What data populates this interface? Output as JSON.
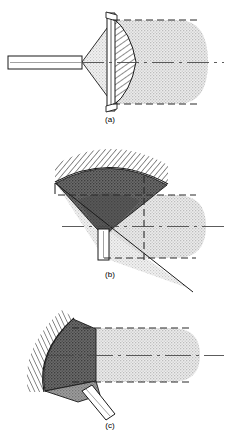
{
  "figure": {
    "name": "ultrasonic-transducer-beam-focusing-figure",
    "width": 226,
    "height": 442,
    "background": "#ffffff"
  },
  "colors": {
    "background": "#ffffff",
    "outline": "#1a1a1a",
    "beam_fill": "#e2e2e2",
    "beam_fill_light": "#eaeaea",
    "cone_dark": "#5a5a5a",
    "cone_mid": "#8c8c8c",
    "wedge_dark": "#6e6e6e",
    "wedge_mid": "#9a9a9a",
    "hatch_stroke": "#2a2a2a",
    "dashed_stroke": "#2a2a2a",
    "centerline": "#3a3a3a",
    "caption_text": "#4a4a4a",
    "lens_hatch": "#2e2e2e"
  },
  "panels": [
    {
      "id": "a",
      "caption": "(a)",
      "caption_x": 110,
      "caption_y": 122,
      "description": "flat transducer with plano-convex focusing lens on axial rod",
      "centerline_y": 62,
      "elements": {
        "rod": {
          "name": "transducer-rod",
          "x": 8,
          "y": 56,
          "width": 74,
          "height": 13
        },
        "lens": {
          "name": "focusing-lens",
          "face_x": 113,
          "top_y": 16,
          "bottom_y": 108
        },
        "plate": {
          "name": "transducer-plate",
          "x": 108,
          "top_y": 12,
          "bottom_y": 112
        },
        "beam": {
          "name": "beam-field",
          "left_x": 113,
          "right_x": 208,
          "top_y": 20,
          "bottom_y": 104
        },
        "cone": {
          "name": "convergence-cone",
          "apex_x": 82,
          "base_x": 113
        }
      }
    },
    {
      "id": "b",
      "caption": "(b)",
      "caption_x": 110,
      "caption_y": 277,
      "description": "concave curved reflector with conical beam and vertical stem",
      "centerline_y": 226,
      "elements": {
        "reflector_arc": {
          "name": "curved-reflector-surface",
          "hatched": true
        },
        "cone": {
          "name": "focusing-cone",
          "apex_x": 104,
          "apex_y": 228
        },
        "stem": {
          "name": "support-stem",
          "x": 98,
          "y": 228,
          "width": 11,
          "height": 30
        },
        "beam": {
          "name": "beam-field",
          "left_x": 104,
          "right_x": 206,
          "top_y": 195,
          "bottom_y": 258
        }
      }
    },
    {
      "id": "c",
      "caption": "(c)",
      "caption_x": 110,
      "caption_y": 428,
      "description": "angled curved reflector with oblique stem and horizontal beam",
      "centerline_y": 355,
      "elements": {
        "reflector_arc": {
          "name": "curved-reflector-surface",
          "hatched": true
        },
        "wedge": {
          "name": "reflector-wedge",
          "top_x": 70,
          "top_y": 325
        },
        "stem": {
          "name": "angled-support-stem",
          "angle_deg": 42
        },
        "beam": {
          "name": "beam-field",
          "left_x": 72,
          "right_x": 200,
          "top_y": 328,
          "bottom_y": 382
        }
      }
    }
  ]
}
